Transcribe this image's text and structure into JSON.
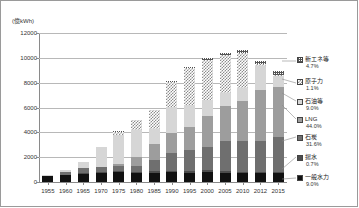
{
  "axis_unit_label": "(億kWh)",
  "chart_data": {
    "type": "bar",
    "stacked": true,
    "title": "",
    "subtitle": "",
    "xlabel": "",
    "ylabel": "(億kWh)",
    "ylim": [
      0,
      12000
    ],
    "yticks": [
      0,
      2000,
      4000,
      6000,
      8000,
      10000,
      12000
    ],
    "ytick_labels": [
      "0",
      "2000",
      "4000",
      "6000",
      "8000",
      "10000",
      "12000"
    ],
    "grid": true,
    "legend_position": "right",
    "categories": [
      "1955",
      "1960",
      "1965",
      "1970",
      "1975",
      "1980",
      "1985",
      "1990",
      "1995",
      "2000",
      "2005",
      "2010",
      "2012",
      "2015"
    ],
    "series": [
      {
        "name": "一般水力",
        "share_label": "9.0%",
        "color": "#111111",
        "pattern": "solid-black",
        "values": [
          480,
          550,
          700,
          760,
          810,
          780,
          760,
          780,
          740,
          770,
          720,
          710,
          700,
          710
        ]
      },
      {
        "name": "揚水",
        "share_label": "0.7%",
        "color": "#4d4d4d",
        "pattern": "solid-dark-gray",
        "values": [
          0,
          0,
          10,
          20,
          40,
          60,
          90,
          120,
          150,
          170,
          170,
          130,
          90,
          60
        ]
      },
      {
        "name": "石炭",
        "share_label": "31.6%",
        "color": "#6f6f6f",
        "pattern": "solid-mid-gray",
        "values": [
          80,
          260,
          380,
          430,
          420,
          450,
          900,
          1450,
          1690,
          1870,
          2430,
          2500,
          2550,
          2850
        ]
      },
      {
        "name": "LNG",
        "share_label": "44.0%",
        "color": "#9d9d9d",
        "pattern": "solid-light-gray",
        "values": [
          0,
          0,
          0,
          0,
          190,
          720,
          1310,
          1590,
          1870,
          2510,
          2840,
          3200,
          4070,
          4010
        ]
      },
      {
        "name": "石油等",
        "share_label": "9.0%",
        "color": "#d6d6d6",
        "pattern": "solid-pale-gray",
        "values": [
          10,
          130,
          530,
          1670,
          2340,
          2210,
          1220,
          2110,
          1790,
          1270,
          1020,
          1000,
          1910,
          900
        ]
      },
      {
        "name": "原子力",
        "share_label": "1.1%",
        "color": "#8d8d8d",
        "pattern": "checkerboard",
        "values": [
          0,
          0,
          0,
          50,
          250,
          820,
          1590,
          2020,
          2910,
          3220,
          3050,
          2880,
          160,
          90
        ]
      },
      {
        "name": "新エネ等",
        "share_label": "4.7%",
        "color": "#555555",
        "pattern": "fine-grid",
        "values": [
          0,
          0,
          0,
          0,
          20,
          30,
          50,
          80,
          130,
          180,
          200,
          230,
          250,
          360
        ]
      }
    ],
    "totals": [
      570,
      940,
      1620,
      2930,
      4070,
      5070,
      5920,
      8150,
      9280,
      10000,
      10430,
      10650,
      9730,
      8980
    ]
  }
}
